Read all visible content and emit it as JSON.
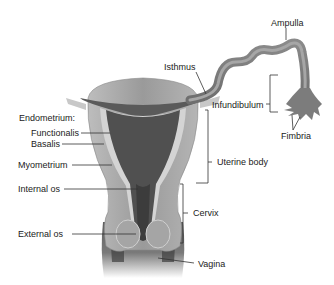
{
  "diagram": {
    "colors": {
      "myometrium": "#9a9a9a",
      "endometrium_functionalis": "#555555",
      "endometrium_basalis": "#cfcfcf",
      "tube_outer": "#7d7d7d",
      "tube_inner": "#a8a8a8",
      "vagina": "#6a6a6a",
      "leader": "#333333",
      "text": "#222222",
      "background": "#ffffff"
    },
    "labels": {
      "ampulla": "Ampulla",
      "isthmus": "Isthmus",
      "infundibulum": "Infundibulum",
      "fimbria": "Fimbria",
      "endometrium": "Endometrium:",
      "functionalis": "Functionalis",
      "basalis": "Basalis",
      "myometrium": "Myometrium",
      "uterine_body": "Uterine body",
      "internal_os": "Internal os",
      "cervix": "Cervix",
      "external_os": "External os",
      "vagina": "Vagina"
    }
  }
}
